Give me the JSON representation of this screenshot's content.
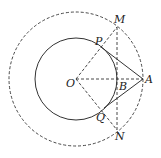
{
  "diagram": {
    "colors": {
      "stroke": "#333333",
      "background": "#ffffff"
    },
    "points": {
      "O": {
        "label": "O",
        "x": 76,
        "y": 79
      },
      "A": {
        "label": "A",
        "x": 143,
        "y": 79
      },
      "B": {
        "label": "B",
        "x": 117,
        "y": 79
      },
      "M": {
        "label": "M",
        "x": 117,
        "y": 27
      },
      "N": {
        "label": "N",
        "x": 117,
        "y": 130
      },
      "P": {
        "label": "P",
        "x": 101,
        "y": 47
      },
      "Q": {
        "label": "Q",
        "x": 104,
        "y": 108
      }
    },
    "circles": [
      {
        "name": "inner-circle",
        "center": "O",
        "radius": 41,
        "style": "solid"
      },
      {
        "name": "outer-circle",
        "center": "O",
        "radius": 67,
        "style": "dashed"
      }
    ],
    "segments": [
      {
        "from": "P",
        "to": "A",
        "style": "solid"
      },
      {
        "from": "Q",
        "to": "A",
        "style": "solid"
      },
      {
        "from": "O",
        "to": "A",
        "style": "dashed"
      },
      {
        "from": "O",
        "to": "M",
        "style": "dashed"
      },
      {
        "from": "O",
        "to": "N",
        "style": "dashed"
      },
      {
        "from": "M",
        "to": "N",
        "style": "dashed"
      }
    ]
  }
}
